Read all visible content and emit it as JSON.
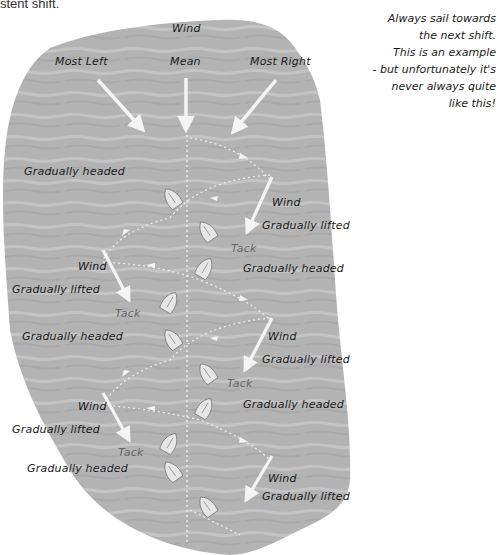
{
  "caption": "stent shift.",
  "note": {
    "lines": [
      "Always sail towards",
      "the next shift.",
      "This is an example",
      "- but unfortunately it's",
      "never always quite",
      "like this!"
    ]
  },
  "colors": {
    "sea": "#b4b4b4",
    "sea_light": "#c6c6c6",
    "arrow": "#f4f4f4",
    "text": "#1a1a1a",
    "tack_text": "#6a6a6a"
  },
  "header": {
    "wind": "Wind",
    "most_left": "Most Left",
    "mean": "Mean",
    "most_right": "Most Right"
  },
  "labels": {
    "l1": "Gradually headed",
    "r1_wind": "Wind",
    "r1": "Gradually lifted",
    "r1_tack": "Tack",
    "r2": "Gradually headed",
    "l2_wind": "Wind",
    "l2": "Gradually lifted",
    "l2_tack": "Tack",
    "l3": "Gradually headed",
    "r3_wind": "Wind",
    "r3": "Gradually lifted",
    "r3_tack": "Tack",
    "r4": "Gradually headed",
    "l4_wind": "Wind",
    "l4": "Gradually lifted",
    "l4_tack": "Tack",
    "l5": "Gradually headed",
    "r5_wind": "Wind",
    "r5": "Gradually lifted"
  }
}
